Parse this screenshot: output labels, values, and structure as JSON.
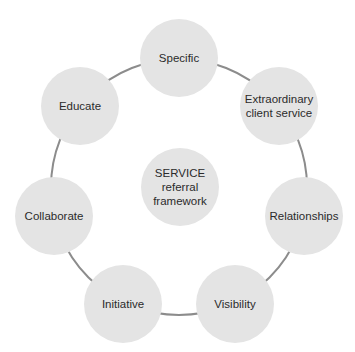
{
  "diagram": {
    "title": "SERVICE referral framework",
    "center": {
      "label": "SERVICE\nreferral\nframework"
    },
    "nodes": [
      {
        "label": "Specific"
      },
      {
        "label": "Extraordinary\nclient service"
      },
      {
        "label": "Relationships"
      },
      {
        "label": "Visibility"
      },
      {
        "label": "Initiative"
      },
      {
        "label": "Collaborate"
      },
      {
        "label": "Educate"
      }
    ],
    "colors": {
      "node_fill": "#e4e4e4",
      "ring_stroke": "#8c8c8c",
      "text": "#2b2b2b"
    }
  }
}
